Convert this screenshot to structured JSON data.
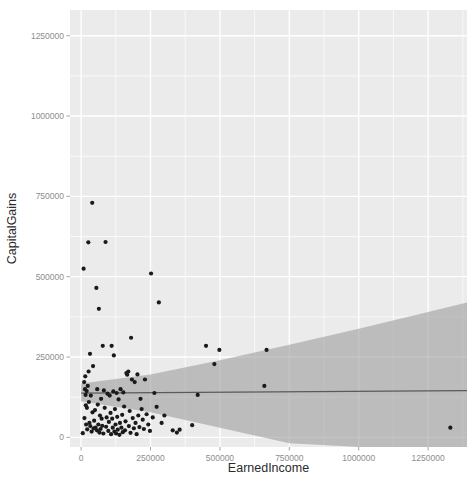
{
  "chart_data": {
    "type": "scatter",
    "title": "",
    "subtitle": "",
    "xlabel": "EarnedIncome",
    "ylabel": "CapitalGains",
    "xlim": [
      -40000,
      1390000
    ],
    "ylim": [
      -30000,
      1330000
    ],
    "x_ticks": [
      0,
      250000,
      500000,
      750000,
      1000000,
      1250000
    ],
    "x_tick_labels": [
      "0",
      "250000",
      "500000",
      "750000",
      "1000000",
      "1250000"
    ],
    "y_ticks": [
      0,
      250000,
      500000,
      750000,
      1000000,
      1250000
    ],
    "y_tick_labels": [
      "0",
      "250000",
      "500000",
      "750000",
      "1000000",
      "1250000"
    ],
    "grid": true,
    "grid_color": "#ffffff",
    "panel_background": "#ebebeb",
    "point_color": "#1a1a1a",
    "point_size": 2.1,
    "legend": "none",
    "smooth": {
      "method": "lm",
      "line_color": "#5a5a5a",
      "band_color": "#9f9f9f",
      "intercept": 138000,
      "slope": 0.0055,
      "band_lower": [
        [
          0,
          112000
        ],
        [
          250000,
          78000
        ],
        [
          500000,
          30000
        ],
        [
          750000,
          -18000
        ],
        [
          1000000,
          -68000
        ],
        [
          1250000,
          -118000
        ],
        [
          1390000,
          -148000
        ]
      ],
      "band_upper": [
        [
          0,
          168000
        ],
        [
          250000,
          196000
        ],
        [
          500000,
          240000
        ],
        [
          750000,
          288000
        ],
        [
          1000000,
          338000
        ],
        [
          1250000,
          390000
        ],
        [
          1390000,
          420000
        ]
      ]
    },
    "points": [
      [
        6000,
        13000
      ],
      [
        9000,
        525000
      ],
      [
        11000,
        172000
      ],
      [
        12000,
        60000
      ],
      [
        14000,
        150000
      ],
      [
        15000,
        190000
      ],
      [
        16000,
        132000
      ],
      [
        17000,
        100000
      ],
      [
        18000,
        40000
      ],
      [
        20000,
        144000
      ],
      [
        21000,
        92000
      ],
      [
        22000,
        25000
      ],
      [
        24000,
        160000
      ],
      [
        26000,
        607000
      ],
      [
        27000,
        205000
      ],
      [
        28000,
        110000
      ],
      [
        30000,
        45000
      ],
      [
        32000,
        260000
      ],
      [
        33000,
        35000
      ],
      [
        35000,
        130000
      ],
      [
        38000,
        18000
      ],
      [
        40000,
        730000
      ],
      [
        41000,
        78000
      ],
      [
        43000,
        222000
      ],
      [
        45000,
        28000
      ],
      [
        47000,
        52000
      ],
      [
        50000,
        85000
      ],
      [
        52000,
        30000
      ],
      [
        55000,
        465000
      ],
      [
        57000,
        22000
      ],
      [
        58000,
        150000
      ],
      [
        60000,
        102000
      ],
      [
        62000,
        40000
      ],
      [
        64000,
        400000
      ],
      [
        66000,
        15000
      ],
      [
        68000,
        68000
      ],
      [
        70000,
        26000
      ],
      [
        72000,
        120000
      ],
      [
        74000,
        58000
      ],
      [
        76000,
        36000
      ],
      [
        78000,
        285000
      ],
      [
        80000,
        12000
      ],
      [
        82000,
        146000
      ],
      [
        85000,
        92000
      ],
      [
        88000,
        608000
      ],
      [
        90000,
        33000
      ],
      [
        92000,
        62000
      ],
      [
        95000,
        136000
      ],
      [
        98000,
        20000
      ],
      [
        100000,
        48000
      ],
      [
        103000,
        130000
      ],
      [
        106000,
        76000
      ],
      [
        108000,
        10000
      ],
      [
        110000,
        285000
      ],
      [
        112000,
        58000
      ],
      [
        114000,
        30000
      ],
      [
        116000,
        143000
      ],
      [
        118000,
        255000
      ],
      [
        120000,
        18000
      ],
      [
        122000,
        88000
      ],
      [
        124000,
        40000
      ],
      [
        126000,
        12000
      ],
      [
        128000,
        138000
      ],
      [
        130000,
        64000
      ],
      [
        132000,
        24000
      ],
      [
        135000,
        118000
      ],
      [
        138000,
        8000
      ],
      [
        140000,
        45000
      ],
      [
        142000,
        150000
      ],
      [
        145000,
        30000
      ],
      [
        148000,
        70000
      ],
      [
        150000,
        16000
      ],
      [
        152000,
        140000
      ],
      [
        155000,
        96000
      ],
      [
        158000,
        22000
      ],
      [
        160000,
        50000
      ],
      [
        163000,
        200000
      ],
      [
        166000,
        195000
      ],
      [
        170000,
        205000
      ],
      [
        172000,
        35000
      ],
      [
        175000,
        82000
      ],
      [
        178000,
        14000
      ],
      [
        180000,
        310000
      ],
      [
        183000,
        180000
      ],
      [
        186000,
        60000
      ],
      [
        190000,
        28000
      ],
      [
        193000,
        172000
      ],
      [
        196000,
        45000
      ],
      [
        200000,
        10000
      ],
      [
        203000,
        196000
      ],
      [
        206000,
        68000
      ],
      [
        210000,
        32000
      ],
      [
        214000,
        120000
      ],
      [
        218000,
        88000
      ],
      [
        222000,
        55000
      ],
      [
        226000,
        26000
      ],
      [
        230000,
        180000
      ],
      [
        236000,
        72000
      ],
      [
        242000,
        40000
      ],
      [
        248000,
        20000
      ],
      [
        252000,
        510000
      ],
      [
        258000,
        62000
      ],
      [
        264000,
        138000
      ],
      [
        272000,
        95000
      ],
      [
        280000,
        420000
      ],
      [
        290000,
        45000
      ],
      [
        300000,
        68000
      ],
      [
        330000,
        22000
      ],
      [
        345000,
        15000
      ],
      [
        355000,
        24000
      ],
      [
        400000,
        38000
      ],
      [
        420000,
        132000
      ],
      [
        450000,
        285000
      ],
      [
        480000,
        228000
      ],
      [
        498000,
        272000
      ],
      [
        660000,
        160000
      ],
      [
        668000,
        272000
      ],
      [
        1330000,
        30000
      ]
    ]
  },
  "axis": {
    "x_title": "EarnedIncome",
    "y_title": "CapitalGains"
  }
}
